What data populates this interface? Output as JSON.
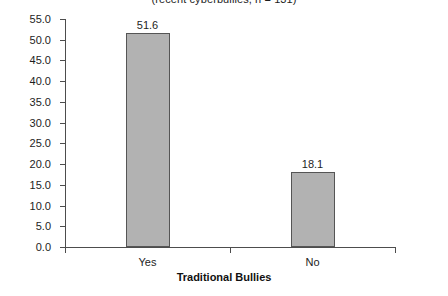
{
  "chart_data": {
    "type": "bar",
    "title": "(recent cyberbullies, n = 131)",
    "xlabel": "Traditional Bullies",
    "ylabel": "",
    "categories": [
      "Yes",
      "No"
    ],
    "values": [
      51.6,
      18.1
    ],
    "value_labels": [
      "51.6",
      "18.1"
    ],
    "ylim": [
      0.0,
      55.0
    ],
    "ytick_labels": [
      "0.0",
      "5.0",
      "10.0",
      "15.0",
      "20.0",
      "25.0",
      "30.0",
      "35.0",
      "40.0",
      "45.0",
      "50.0",
      "55.0"
    ],
    "ytick_values": [
      0.0,
      5.0,
      10.0,
      15.0,
      20.0,
      25.0,
      30.0,
      35.0,
      40.0,
      45.0,
      50.0,
      55.0
    ],
    "grid": false,
    "legend": null,
    "bar_fill_color": "#b2b2b2",
    "bar_edge_color": "#555555",
    "axis_color": "#4d4d4d",
    "background_color": "#ffffff"
  }
}
